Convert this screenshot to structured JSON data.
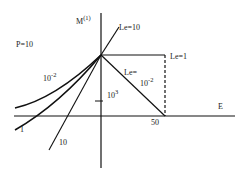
{
  "diagram": {
    "y_axis_label": "M",
    "y_axis_superscript": "(1)",
    "x_axis_label": "E",
    "parameter_label": "P=10",
    "x_tick_label": "50",
    "y_tick_label_base": "10",
    "y_tick_label_exp": "3",
    "curves": {
      "le10_label": "Le=10",
      "le1_label": "Le=1",
      "le_small_label_top": "Le=",
      "le_small_label_base": "10",
      "le_small_label_exp": "-2",
      "left_small_base": "10",
      "left_small_exp": "-2",
      "left_one": "1",
      "left_ten": "10"
    }
  }
}
